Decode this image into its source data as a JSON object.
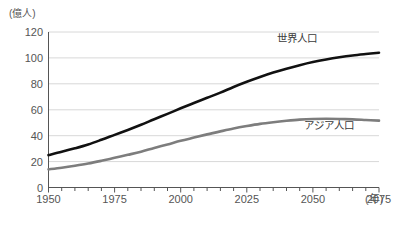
{
  "chart_data": {
    "type": "line",
    "title": "",
    "subtitle": "",
    "unit_label": "(億人)",
    "xlabel": "(年)",
    "ylabel": "",
    "xlim": [
      1950,
      2075
    ],
    "ylim": [
      0,
      120
    ],
    "grid": true,
    "grid_axis": "y",
    "legend_position": "inline-right",
    "x_major_ticks": [
      1950,
      1975,
      2000,
      2025,
      2050,
      2075
    ],
    "x_major_tick_labels": [
      "1950",
      "1975",
      "2000",
      "2025",
      "2050",
      "2075"
    ],
    "x_minor_tick_step": 5,
    "y_ticks": [
      0,
      20,
      40,
      60,
      80,
      100,
      120
    ],
    "y_tick_labels": [
      "0",
      "20",
      "40",
      "60",
      "80",
      "100",
      "120"
    ],
    "x": [
      1950,
      1955,
      1960,
      1965,
      1970,
      1975,
      1980,
      1985,
      1990,
      1995,
      2000,
      2005,
      2010,
      2015,
      2020,
      2025,
      2030,
      2035,
      2040,
      2045,
      2050,
      2055,
      2060,
      2065,
      2070,
      2075
    ],
    "series": [
      {
        "name": "世界人口",
        "color": "#111111",
        "values": [
          25.0,
          27.5,
          30.2,
          33.2,
          36.8,
          40.6,
          44.4,
          48.4,
          52.7,
          56.8,
          61.1,
          65.2,
          69.2,
          73.2,
          77.6,
          81.6,
          85.3,
          88.7,
          91.7,
          94.4,
          96.8,
          98.8,
          100.5,
          101.9,
          103.0,
          104.0
        ]
      },
      {
        "name": "アジア人口",
        "color": "#7d7d7d",
        "values": [
          14.0,
          15.3,
          16.8,
          18.5,
          20.6,
          22.9,
          25.2,
          27.6,
          30.5,
          33.2,
          36.0,
          38.5,
          41.0,
          43.3,
          45.5,
          47.4,
          49.1,
          50.4,
          51.5,
          52.4,
          52.9,
          53.0,
          52.9,
          52.6,
          52.1,
          51.6
        ]
      }
    ],
    "annotations": [
      {
        "text": "世界人口",
        "x": 2044,
        "y": 112
      },
      {
        "text": "アジア人口",
        "x": 2056,
        "y": 45
      }
    ]
  },
  "axes": {
    "y_unit": "(億人)",
    "x_unit": "(年)"
  },
  "colors": {
    "world_line": "#111111",
    "asia_line": "#7d7d7d",
    "gridline": "#d8d8d8",
    "axis": "#555555",
    "text": "#555555",
    "background": "#ffffff"
  }
}
